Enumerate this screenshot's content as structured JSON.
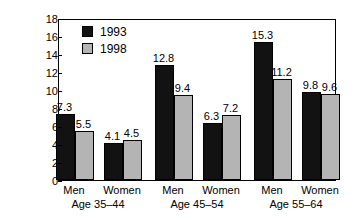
{
  "chart_data": {
    "type": "bar",
    "title": "",
    "subtitle": "",
    "xlabel": "",
    "ylabel": "Years of tenure",
    "ylim": [
      0,
      18
    ],
    "ytick_step": 2,
    "yticks": [
      "18",
      "16",
      "14",
      "12",
      "10",
      "8",
      "6",
      "4",
      "2",
      "0"
    ],
    "grid": false,
    "legend_position": "top-left-inside",
    "categories": [
      "Men",
      "Women",
      "Men",
      "Women",
      "Men",
      "Women"
    ],
    "groups": [
      {
        "age_label": "Age 35–44",
        "bars": [
          {
            "sex": "Men",
            "series": "1993",
            "value": 7.3,
            "value_label": "7.3"
          },
          {
            "sex": "Men",
            "series": "1998",
            "value": 5.5,
            "value_label": "5.5"
          },
          {
            "sex": "Women",
            "series": "1993",
            "value": 4.1,
            "value_label": "4.1"
          },
          {
            "sex": "Women",
            "series": "1998",
            "value": 4.5,
            "value_label": "4.5"
          }
        ]
      },
      {
        "age_label": "Age 45–54",
        "bars": [
          {
            "sex": "Men",
            "series": "1993",
            "value": 12.8,
            "value_label": "12.8"
          },
          {
            "sex": "Men",
            "series": "1998",
            "value": 9.4,
            "value_label": "9.4"
          },
          {
            "sex": "Women",
            "series": "1993",
            "value": 6.3,
            "value_label": "6.3"
          },
          {
            "sex": "Women",
            "series": "1998",
            "value": 7.2,
            "value_label": "7.2"
          }
        ]
      },
      {
        "age_label": "Age 55–64",
        "bars": [
          {
            "sex": "Men",
            "series": "1993",
            "value": 15.3,
            "value_label": "15.3"
          },
          {
            "sex": "Men",
            "series": "1998",
            "value": 11.2,
            "value_label": "11.2"
          },
          {
            "sex": "Women",
            "series": "1993",
            "value": 9.8,
            "value_label": "9.8"
          },
          {
            "sex": "Women",
            "series": "1998",
            "value": 9.6,
            "value_label": "9.6"
          }
        ]
      }
    ],
    "series": [
      {
        "name": "1993",
        "color": "#121212",
        "values": [
          7.3,
          4.1,
          12.8,
          6.3,
          15.3,
          9.8
        ]
      },
      {
        "name": "1998",
        "color": "#b4b4b4",
        "values": [
          5.5,
          4.5,
          9.4,
          7.2,
          11.2,
          9.6
        ]
      }
    ]
  },
  "legend": {
    "items": [
      {
        "label": "1993",
        "color": "#121212"
      },
      {
        "label": "1998",
        "color": "#b4b4b4"
      }
    ]
  },
  "axis": {
    "y_title": "Years of tenure"
  }
}
